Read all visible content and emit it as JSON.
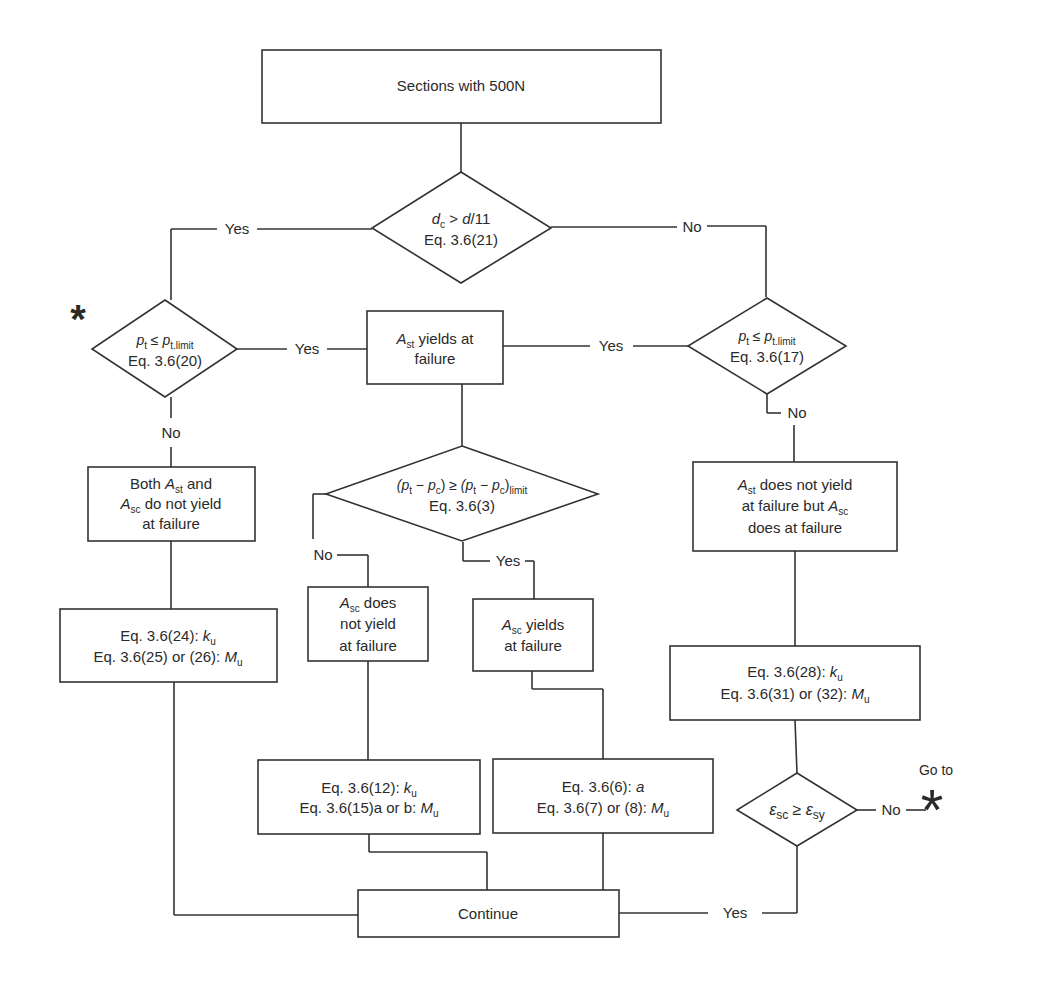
{
  "title": "Sections with 500N",
  "colors": {
    "line": "#333333",
    "text": "#2a2a2a",
    "background": "#ffffff"
  },
  "nodes": {
    "start": {
      "type": "process",
      "text": "Sections with 500N"
    },
    "d1": {
      "type": "decision",
      "line1_var": "d",
      "line1_sub": "c",
      "line1_op": " > ",
      "line1_rhs": "d",
      "line1_rhs_tail": "/11",
      "line2": "Eq. 3.6(21)"
    },
    "d2": {
      "type": "decision",
      "line1_var": "p",
      "line1_sub": "t",
      "line1_op": " ≤ ",
      "line1_rhs": "p",
      "line1_rhs_sub": "t.limit",
      "line2": "Eq. 3.6(20)"
    },
    "p_ast_yields": {
      "type": "process",
      "var": "A",
      "sub": "st",
      "line1_tail": " yields at",
      "line2": "failure"
    },
    "d3": {
      "type": "decision",
      "line1_var": "p",
      "line1_sub": "t",
      "line1_op": " ≤ ",
      "line1_rhs": "p",
      "line1_rhs_sub": "t.limit",
      "line2": "Eq. 3.6(17)"
    },
    "p_both": {
      "type": "process",
      "line1_pre": "Both ",
      "var1": "A",
      "sub1": "st",
      "line1_tail": " and",
      "var2": "A",
      "sub2": "sc",
      "line2_tail": " do not yield",
      "line3": "at failure"
    },
    "d4": {
      "type": "decision",
      "expr_left": "(p",
      "sub_t": "t",
      "minus": " − p",
      "sub_c": "c",
      "close": ")",
      "ge": " ≥ ",
      "expr_right": "(p",
      "minus2": " − p",
      "close2": ")",
      "sub_limit": "limit",
      "line2": "Eq. 3.6(3)"
    },
    "p_ast_not": {
      "type": "process",
      "var1": "A",
      "sub1": "st",
      "line1_tail": " does not yield",
      "line2_pre": "at failure but ",
      "var2": "A",
      "sub2": "sc",
      "line3": "does at failure"
    },
    "p_eq24": {
      "type": "process",
      "line1": "Eq. 3.6(24): ",
      "line1_var": "k",
      "line1_sub": "u",
      "line2": "Eq. 3.6(25) or (26): ",
      "line2_var": "M",
      "line2_sub": "u"
    },
    "p_asc_not": {
      "type": "process",
      "var": "A",
      "sub": "sc",
      "line1_tail": " does",
      "line2": "not yield",
      "line3": "at failure"
    },
    "p_asc_yields": {
      "type": "process",
      "var": "A",
      "sub": "sc",
      "line1_tail": " yields",
      "line2": "at failure"
    },
    "p_eq28": {
      "type": "process",
      "line1": "Eq. 3.6(28): ",
      "line1_var": "k",
      "line1_sub": "u",
      "line2": "Eq. 3.6(31) or (32): ",
      "line2_var": "M",
      "line2_sub": "u"
    },
    "p_eq12": {
      "type": "process",
      "line1": "Eq. 3.6(12): ",
      "line1_var": "k",
      "line1_sub": "u",
      "line2": "Eq. 3.6(15)a or b: ",
      "line2_var": "M",
      "line2_sub": "u"
    },
    "p_eq6": {
      "type": "process",
      "line1": "Eq. 3.6(6): ",
      "line1_var": "a",
      "line2": "Eq. 3.6(7) or (8): ",
      "line2_var": "M",
      "line2_sub": "u"
    },
    "d5": {
      "type": "decision",
      "var1": "ε",
      "sub1": "sc",
      "op": " ≥ ",
      "var2": "ε",
      "sub2": "sy"
    },
    "end": {
      "type": "process",
      "text": "Continue"
    }
  },
  "edge_labels": {
    "d1_yes": "Yes",
    "d1_no": "No",
    "d2_yes": "Yes",
    "d2_no": "No",
    "d3_yes": "Yes",
    "d3_no": "No",
    "d4_no": "No",
    "d4_yes": "Yes",
    "d5_no": "No",
    "d5_yes": "Yes"
  },
  "markers": {
    "loop_target": "*",
    "goto_label": "Go to",
    "goto_star": "*"
  }
}
